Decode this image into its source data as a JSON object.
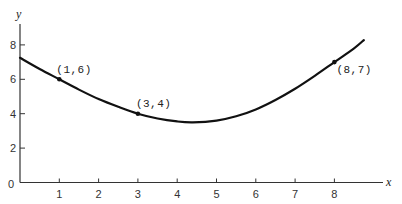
{
  "chart_data": {
    "type": "line",
    "title": "",
    "xlabel": "x",
    "ylabel": "y",
    "xlim": [
      0,
      9
    ],
    "ylim": [
      0,
      9
    ],
    "grid": false,
    "legend": null,
    "x_ticks": [
      1,
      2,
      3,
      4,
      5,
      6,
      7,
      8
    ],
    "y_ticks": [
      0,
      2,
      4,
      6,
      8
    ],
    "series": [
      {
        "name": "curve",
        "color": "#111111",
        "x": [
          0,
          0.5,
          1,
          1.5,
          2,
          2.5,
          3,
          3.5,
          4,
          4.4,
          5,
          5.5,
          6,
          6.5,
          7,
          7.5,
          8,
          8.5,
          8.75
        ],
        "y": [
          7.25,
          6.6,
          6.0,
          5.4,
          4.85,
          4.4,
          4.0,
          3.72,
          3.55,
          3.5,
          3.6,
          3.85,
          4.25,
          4.8,
          5.45,
          6.2,
          7.0,
          7.8,
          8.28
        ]
      }
    ],
    "annotations": [
      {
        "x": 1,
        "y": 6,
        "text": "(1,6)"
      },
      {
        "x": 3,
        "y": 4,
        "text": "(3,4)"
      },
      {
        "x": 8,
        "y": 7,
        "text": "(8,7)"
      }
    ]
  },
  "axes": {
    "x_title": "x",
    "y_title": "y",
    "origin_label": "0"
  }
}
